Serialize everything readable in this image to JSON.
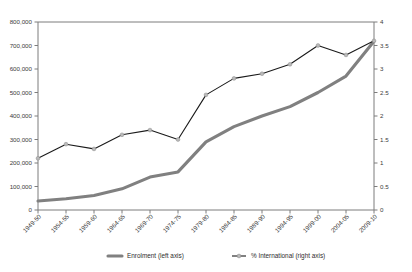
{
  "chart_data": {
    "type": "line",
    "title": "",
    "subtitle": "",
    "xlabel": "",
    "ylabel": "",
    "grid": false,
    "legend_position": "bottom",
    "categories": [
      "1949-50",
      "1954-55",
      "1959-60",
      "1964-65",
      "1969-70",
      "1974-75",
      "1979-80",
      "1984-85",
      "1989-90",
      "1994-95",
      "1999-00",
      "2004-05",
      "2009-10"
    ],
    "axes": {
      "left": {
        "label": "Enrolment",
        "ylim": [
          0,
          800000
        ],
        "ticks": [
          0,
          100000,
          200000,
          300000,
          400000,
          500000,
          600000,
          700000,
          800000
        ],
        "tick_labels": [
          "0",
          "100,000",
          "200,000",
          "300,000",
          "400,000",
          "500,000",
          "600,000",
          "700,000",
          "800,000"
        ]
      },
      "right": {
        "label": "% International",
        "ylim": [
          0,
          4
        ],
        "ticks": [
          0,
          0.5,
          1,
          1.5,
          2,
          2.5,
          3,
          3.5,
          4
        ],
        "tick_labels": [
          "0",
          "0.5",
          "1",
          "1.5",
          "2",
          "2.5",
          "3",
          "3.5",
          "4"
        ]
      }
    },
    "series": [
      {
        "name": "Enrolment (left axis)",
        "axis": "left",
        "color": "#808080",
        "markers": false,
        "values": [
          38000,
          48000,
          62000,
          90000,
          140000,
          162000,
          290000,
          355000,
          400000,
          440000,
          500000,
          570000,
          718000
        ]
      },
      {
        "name": "% International (right axis)",
        "axis": "right",
        "color": "#1a1a1a",
        "markers": true,
        "values": [
          1.1,
          1.4,
          1.3,
          1.6,
          1.7,
          1.5,
          2.45,
          2.8,
          2.9,
          3.1,
          3.5,
          3.3,
          3.6
        ]
      }
    ],
    "legend": [
      {
        "label": "Enrolment (left axis)",
        "color": "#808080",
        "style": "thick-line"
      },
      {
        "label": "% International (right axis)",
        "color": "#1a1a1a",
        "style": "line-with-marker"
      }
    ]
  }
}
